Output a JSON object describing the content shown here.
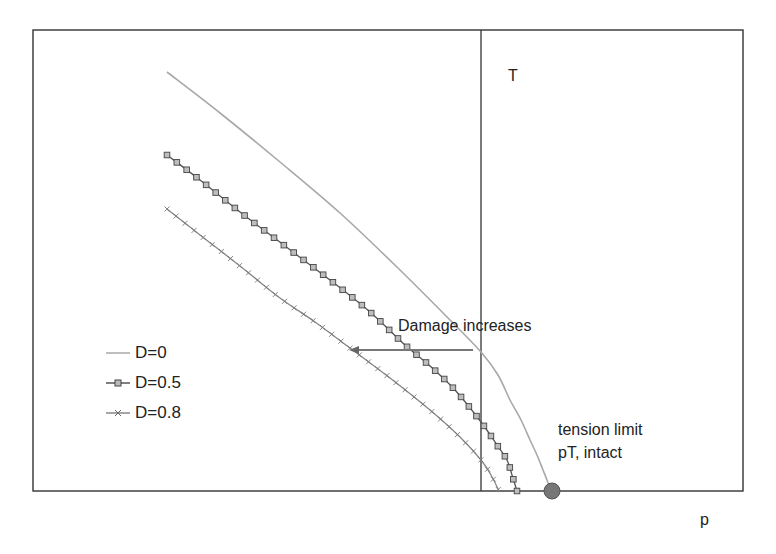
{
  "chart_data": {
    "type": "line",
    "title": "",
    "xlabel": "p",
    "ylabel": "T",
    "grid": false,
    "legend_position": "inside left",
    "pixel_frame": {
      "left": 33,
      "top": 30,
      "right": 743,
      "bottom": 491,
      "axis_x": 481
    },
    "series": [
      {
        "name": "D=0",
        "color": "#a8a8a8",
        "marker": "none",
        "points": [
          [
            167,
            72
          ],
          [
            220,
            113
          ],
          [
            280,
            162
          ],
          [
            340,
            213
          ],
          [
            400,
            270
          ],
          [
            450,
            320
          ],
          [
            481,
            352
          ],
          [
            498,
            375
          ],
          [
            510,
            400
          ],
          [
            521,
            420
          ],
          [
            530,
            440
          ],
          [
            537,
            455
          ],
          [
            543,
            470
          ],
          [
            547,
            480
          ],
          [
            551,
            491
          ]
        ]
      },
      {
        "name": "D=0.5",
        "color": "#555555",
        "marker": "square",
        "points": [
          [
            167,
            155
          ],
          [
            200,
            180
          ],
          [
            240,
            212
          ],
          [
            285,
            246
          ],
          [
            330,
            280
          ],
          [
            370,
            312
          ],
          [
            405,
            345
          ],
          [
            430,
            366
          ],
          [
            455,
            390
          ],
          [
            481,
            422
          ],
          [
            497,
            445
          ],
          [
            507,
            460
          ],
          [
            512,
            475
          ],
          [
            517,
            491
          ]
        ]
      },
      {
        "name": "D=0.8",
        "color": "#888888",
        "marker": "cross",
        "points": [
          [
            167,
            209
          ],
          [
            200,
            235
          ],
          [
            240,
            266
          ],
          [
            280,
            298
          ],
          [
            315,
            322
          ],
          [
            350,
            348
          ],
          [
            390,
            378
          ],
          [
            430,
            410
          ],
          [
            460,
            437
          ],
          [
            481,
            460
          ],
          [
            491,
            475
          ],
          [
            499,
            491
          ]
        ]
      }
    ],
    "annotations": [
      {
        "text": "Damage increases",
        "x": 398,
        "y": 318,
        "arrow": {
          "from": [
            473,
            350
          ],
          "to": [
            349,
            350
          ]
        }
      },
      {
        "text": "tension limit",
        "x": 558,
        "y": 422
      },
      {
        "text": "pT, intact",
        "x": 558,
        "y": 445
      },
      {
        "marker": "circle",
        "label": "pT",
        "x": 552,
        "y": 491,
        "r": 8,
        "color": "#777777"
      }
    ]
  },
  "labels": {
    "y_axis": "T",
    "x_axis": "p",
    "damage": "Damage increases",
    "tension1": "tension limit",
    "tension2": "pT, intact"
  },
  "legend": [
    {
      "label": "D=0"
    },
    {
      "label": "D=0.5"
    },
    {
      "label": "D=0.8"
    }
  ]
}
